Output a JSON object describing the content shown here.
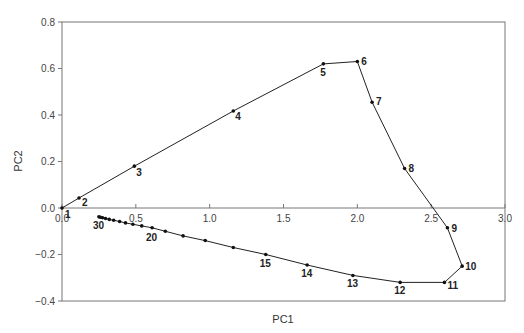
{
  "chart_data": {
    "type": "line",
    "title": "",
    "xlabel": "PC1",
    "ylabel": "PC2",
    "xlim": [
      0.0,
      3.0
    ],
    "ylim": [
      -0.4,
      0.8
    ],
    "x_ticks": [
      "0.0",
      "0.5",
      "1.0",
      "1.5",
      "2.0",
      "2.5",
      "3.0"
    ],
    "y_ticks": [
      "-0.4",
      "-0.2",
      "0.0",
      "0.2",
      "0.4",
      "0.6",
      "0.8"
    ],
    "grid": false,
    "legend": null,
    "series": [
      {
        "name": "trajectory",
        "points": [
          {
            "id": 1,
            "x": 0.0,
            "y": 0.0,
            "label": "1"
          },
          {
            "id": 2,
            "x": 0.115,
            "y": 0.043,
            "label": "2"
          },
          {
            "id": 3,
            "x": 0.49,
            "y": 0.18,
            "label": "3"
          },
          {
            "id": 4,
            "x": 1.16,
            "y": 0.417,
            "label": "4"
          },
          {
            "id": 5,
            "x": 1.77,
            "y": 0.62,
            "label": "5"
          },
          {
            "id": 6,
            "x": 2.0,
            "y": 0.63,
            "label": "6"
          },
          {
            "id": 7,
            "x": 2.1,
            "y": 0.455,
            "label": "7"
          },
          {
            "id": 8,
            "x": 2.32,
            "y": 0.17,
            "label": "8"
          },
          {
            "id": 9,
            "x": 2.61,
            "y": -0.085,
            "label": "9"
          },
          {
            "id": 10,
            "x": 2.71,
            "y": -0.25,
            "label": "10"
          },
          {
            "id": 11,
            "x": 2.59,
            "y": -0.32,
            "label": "11"
          },
          {
            "id": 12,
            "x": 2.29,
            "y": -0.32,
            "label": "12"
          },
          {
            "id": 13,
            "x": 1.97,
            "y": -0.29,
            "label": "13"
          },
          {
            "id": 14,
            "x": 1.66,
            "y": -0.245,
            "label": "14"
          },
          {
            "id": 15,
            "x": 1.38,
            "y": -0.2,
            "label": "15"
          },
          {
            "id": 16,
            "x": 1.16,
            "y": -0.17,
            "label": ""
          },
          {
            "id": 17,
            "x": 0.97,
            "y": -0.14,
            "label": ""
          },
          {
            "id": 18,
            "x": 0.82,
            "y": -0.12,
            "label": ""
          },
          {
            "id": 19,
            "x": 0.7,
            "y": -0.1,
            "label": ""
          },
          {
            "id": 20,
            "x": 0.61,
            "y": -0.085,
            "label": "20"
          },
          {
            "id": 21,
            "x": 0.54,
            "y": -0.077,
            "label": ""
          },
          {
            "id": 22,
            "x": 0.48,
            "y": -0.07,
            "label": ""
          },
          {
            "id": 23,
            "x": 0.43,
            "y": -0.064,
            "label": ""
          },
          {
            "id": 24,
            "x": 0.39,
            "y": -0.058,
            "label": ""
          },
          {
            "id": 25,
            "x": 0.35,
            "y": -0.053,
            "label": ""
          },
          {
            "id": 26,
            "x": 0.32,
            "y": -0.049,
            "label": ""
          },
          {
            "id": 27,
            "x": 0.295,
            "y": -0.045,
            "label": ""
          },
          {
            "id": 28,
            "x": 0.275,
            "y": -0.042,
            "label": ""
          },
          {
            "id": 29,
            "x": 0.26,
            "y": -0.04,
            "label": ""
          },
          {
            "id": 30,
            "x": 0.25,
            "y": -0.038,
            "label": "30"
          }
        ]
      }
    ]
  },
  "axes": {
    "xlabel": "PC1",
    "ylabel": "PC2"
  }
}
